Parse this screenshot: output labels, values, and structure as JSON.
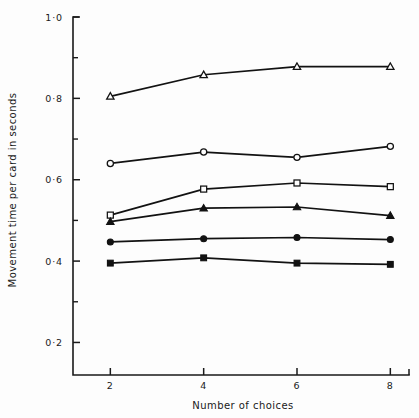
{
  "chart_data": {
    "type": "line",
    "title": "",
    "xlabel": "Number of choices",
    "ylabel": "Movement time per card in seconds",
    "x": [
      2,
      4,
      6,
      8
    ],
    "xlim": [
      1.2,
      8.4
    ],
    "ylim": [
      0.12,
      1.0
    ],
    "grid": false,
    "legend": "none",
    "x_tick_labels": [
      "2",
      "4",
      "6",
      "8"
    ],
    "y_tick_labels": [
      "1·0",
      "0·8",
      "0·6",
      "0·4",
      "0·2"
    ],
    "y_tick_values": [
      1.0,
      0.8,
      0.6,
      0.4,
      0.2
    ],
    "y_minor_tick_values": [
      0.9,
      0.7,
      0.5,
      0.3
    ],
    "series": [
      {
        "name": "series-open-triangle",
        "marker": "open-triangle",
        "values": [
          0.805,
          0.858,
          0.878,
          0.878
        ]
      },
      {
        "name": "series-open-circle",
        "marker": "open-circle",
        "values": [
          0.64,
          0.668,
          0.655,
          0.682
        ]
      },
      {
        "name": "series-open-square",
        "marker": "open-square",
        "values": [
          0.513,
          0.577,
          0.592,
          0.583
        ]
      },
      {
        "name": "series-filled-triangle",
        "marker": "filled-triangle",
        "values": [
          0.497,
          0.53,
          0.533,
          0.512
        ]
      },
      {
        "name": "series-filled-circle",
        "marker": "filled-circle",
        "values": [
          0.447,
          0.455,
          0.458,
          0.453
        ]
      },
      {
        "name": "series-filled-square",
        "marker": "filled-square",
        "values": [
          0.395,
          0.408,
          0.395,
          0.392
        ]
      }
    ]
  }
}
